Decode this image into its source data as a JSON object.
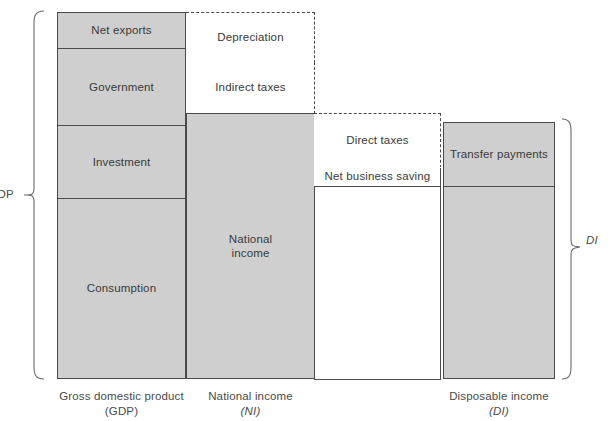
{
  "diagram": {
    "fill_color": "#cfcfcf",
    "line_color": "#4a4a4a",
    "text_color": "#3a3a3a",
    "background": "#ffffff"
  },
  "gdp_column": {
    "components": [
      {
        "label": "Net exports"
      },
      {
        "label": "Government"
      },
      {
        "label": "Investment"
      },
      {
        "label": "Consumption"
      }
    ]
  },
  "ni_column": {
    "deductions": [
      {
        "label": "Depreciation"
      },
      {
        "label": "Indirect taxes"
      }
    ],
    "main": {
      "label": "National\nincome",
      "line1": "National",
      "line2": "income"
    }
  },
  "di_column": {
    "deductions": [
      {
        "label": "Direct taxes"
      },
      {
        "label": "Net business saving"
      }
    ],
    "additions": [
      {
        "label": "Transfer payments"
      }
    ]
  },
  "axis_labels": [
    {
      "line1": "Gross domestic product",
      "line2": "(GDP)"
    },
    {
      "line1": "National income",
      "line2": "(NI)"
    },
    {
      "line1": "Disposable income",
      "line2": "(DI)"
    }
  ],
  "braces": {
    "left": {
      "label": "GDP"
    },
    "right": {
      "label": "DI"
    }
  }
}
